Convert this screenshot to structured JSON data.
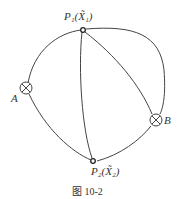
{
  "diagram": {
    "caption": "图 10-2",
    "nodes": [
      {
        "id": "A",
        "label": "A",
        "type": "cross-circle"
      },
      {
        "id": "B",
        "label": "B",
        "type": "cross-circle"
      },
      {
        "id": "P1",
        "label": "P₁(X̃₁)",
        "type": "small-circle"
      },
      {
        "id": "P2",
        "label": "P₂(X̃₂)",
        "type": "small-circle"
      }
    ],
    "edges": [
      {
        "from": "A",
        "to": "P1"
      },
      {
        "from": "A",
        "to": "P2"
      },
      {
        "from": "P1",
        "to": "P2"
      },
      {
        "from": "P1",
        "to": "B",
        "variant": "inner"
      },
      {
        "from": "P1",
        "to": "B",
        "variant": "outer"
      },
      {
        "from": "P2",
        "to": "B"
      }
    ],
    "line_color": "#444444"
  }
}
